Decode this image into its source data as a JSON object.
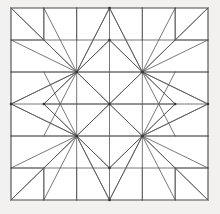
{
  "figure": {
    "title": "Eight-Pointed Star Quilt Block",
    "kind": "geometric-line-drawing",
    "width": 220,
    "height": 214,
    "background_color": "#f2f1ef",
    "block_fill_color": "#ffffff",
    "line_color": "#555555",
    "border_color": "#4a4a4a",
    "vertex_color": "#333333",
    "line_width": 0.8,
    "border_width": 1.1
  },
  "block": {
    "label": "quilt-block",
    "left": 11,
    "top": 8,
    "right": 208,
    "bottom": 200,
    "grid_columns": 6,
    "grid_rows": 6,
    "cell_width": 32.83,
    "cell_height": 32.0,
    "symmetry": "4-fold mirror (dihedral D4)"
  },
  "grid": {
    "x_positions": [
      11,
      43.83,
      76.67,
      109.5,
      142.33,
      175.17,
      208
    ],
    "y_positions": [
      8,
      40,
      72,
      104,
      136,
      168,
      200
    ],
    "show_interior_horizontals": true,
    "show_interior_verticals_edges_only": true
  },
  "key_points": {
    "center": [
      109.5,
      104
    ],
    "star_top": [
      109.5,
      40
    ],
    "star_bottom": [
      109.5,
      168
    ],
    "star_left": [
      43.83,
      104
    ],
    "star_right": [
      175.17,
      104
    ],
    "hub_top_left": [
      76.67,
      72
    ],
    "hub_top_right": [
      142.33,
      72
    ],
    "hub_bottom_left": [
      76.67,
      136
    ],
    "hub_bottom_right": [
      142.33,
      136
    ],
    "edge_mid_left": [
      11,
      104
    ],
    "edge_mid_right": [
      208,
      104
    ],
    "edge_mid_top": [
      109.5,
      8
    ],
    "edge_mid_bottom": [
      109.5,
      200
    ]
  },
  "corner_blocks": {
    "count": 4,
    "description": "square sub-block with single diagonal in each outer corner",
    "size_cells": 1,
    "top_left": {
      "x": 11,
      "y": 8,
      "w": 32.83,
      "h": 32
    },
    "top_right": {
      "x": 175.17,
      "y": 8,
      "w": 32.83,
      "h": 32
    },
    "bottom_left": {
      "x": 11,
      "y": 168,
      "w": 32.83,
      "h": 32
    },
    "bottom_right": {
      "x": 175.17,
      "y": 168,
      "w": 32.83,
      "h": 32
    }
  },
  "chart_data": {
    "type": "line",
    "title": "Eight-Pointed Star Quilt Block",
    "xlabel": "",
    "ylabel": "",
    "xlim": [
      0,
      220
    ],
    "ylim": [
      0,
      214
    ],
    "grid": false,
    "legend": "none",
    "series": [
      {
        "name": "outer-border",
        "kind": "polygon",
        "points": [
          [
            11,
            8
          ],
          [
            208,
            8
          ],
          [
            208,
            200
          ],
          [
            11,
            200
          ]
        ]
      },
      {
        "name": "grid-horizontals",
        "kind": "segments",
        "points": [
          [
            11,
            40
          ],
          [
            208,
            40
          ],
          [
            11,
            72
          ],
          [
            208,
            72
          ],
          [
            11,
            104
          ],
          [
            208,
            104
          ],
          [
            11,
            136
          ],
          [
            208,
            136
          ],
          [
            11,
            168
          ],
          [
            208,
            168
          ]
        ]
      },
      {
        "name": "grid-verticals-outer",
        "kind": "segments",
        "points": [
          [
            43.83,
            8
          ],
          [
            43.83,
            40
          ],
          [
            76.67,
            8
          ],
          [
            76.67,
            40
          ],
          [
            109.5,
            8
          ],
          [
            109.5,
            40
          ],
          [
            142.33,
            8
          ],
          [
            142.33,
            40
          ],
          [
            175.17,
            8
          ],
          [
            175.17,
            40
          ],
          [
            43.83,
            168
          ],
          [
            43.83,
            200
          ],
          [
            76.67,
            168
          ],
          [
            76.67,
            200
          ],
          [
            109.5,
            168
          ],
          [
            109.5,
            200
          ],
          [
            142.33,
            168
          ],
          [
            142.33,
            200
          ],
          [
            175.17,
            168
          ],
          [
            175.17,
            200
          ]
        ]
      },
      {
        "name": "star-outer-diamond",
        "kind": "polygon",
        "points": [
          [
            109.5,
            40
          ],
          [
            175.17,
            104
          ],
          [
            109.5,
            168
          ],
          [
            43.83,
            104
          ]
        ]
      },
      {
        "name": "star-inner-cross",
        "kind": "segments",
        "points": [
          [
            109.5,
            40
          ],
          [
            109.5,
            168
          ],
          [
            43.83,
            104
          ],
          [
            175.17,
            104
          ],
          [
            76.67,
            72
          ],
          [
            142.33,
            136
          ],
          [
            142.33,
            72
          ],
          [
            76.67,
            136
          ]
        ]
      },
      {
        "name": "star-hub-diamond",
        "kind": "polygon",
        "points": [
          [
            76.67,
            72
          ],
          [
            142.33,
            72
          ],
          [
            142.33,
            136
          ],
          [
            76.67,
            136
          ]
        ]
      },
      {
        "name": "hub-rays-top-left",
        "kind": "fan",
        "origin": [
          76.67,
          72
        ],
        "targets": [
          [
            11,
            8
          ],
          [
            43.83,
            8
          ],
          [
            76.67,
            8
          ],
          [
            109.5,
            8
          ],
          [
            11,
            40
          ],
          [
            11,
            72
          ],
          [
            11,
            104
          ],
          [
            43.83,
            136
          ],
          [
            43.83,
            40
          ],
          [
            109.5,
            40
          ],
          [
            43.83,
            104
          ],
          [
            109.5,
            104
          ]
        ]
      },
      {
        "name": "hub-rays-top-right",
        "kind": "fan",
        "origin": [
          142.33,
          72
        ],
        "targets": [
          [
            208,
            8
          ],
          [
            175.17,
            8
          ],
          [
            142.33,
            8
          ],
          [
            109.5,
            8
          ],
          [
            208,
            40
          ],
          [
            208,
            72
          ],
          [
            208,
            104
          ],
          [
            175.17,
            136
          ],
          [
            175.17,
            40
          ],
          [
            109.5,
            40
          ],
          [
            175.17,
            104
          ],
          [
            109.5,
            104
          ]
        ]
      },
      {
        "name": "hub-rays-bottom-left",
        "kind": "fan",
        "origin": [
          76.67,
          136
        ],
        "targets": [
          [
            11,
            200
          ],
          [
            43.83,
            200
          ],
          [
            76.67,
            200
          ],
          [
            109.5,
            200
          ],
          [
            11,
            168
          ],
          [
            11,
            136
          ],
          [
            11,
            104
          ],
          [
            43.83,
            72
          ],
          [
            43.83,
            168
          ],
          [
            109.5,
            168
          ],
          [
            43.83,
            104
          ],
          [
            109.5,
            104
          ]
        ]
      },
      {
        "name": "hub-rays-bottom-right",
        "kind": "fan",
        "origin": [
          142.33,
          136
        ],
        "targets": [
          [
            208,
            200
          ],
          [
            175.17,
            200
          ],
          [
            142.33,
            200
          ],
          [
            109.5,
            200
          ],
          [
            208,
            168
          ],
          [
            208,
            136
          ],
          [
            208,
            104
          ],
          [
            175.17,
            72
          ],
          [
            175.17,
            168
          ],
          [
            109.5,
            168
          ],
          [
            175.17,
            104
          ],
          [
            109.5,
            104
          ]
        ]
      },
      {
        "name": "corner-square-top-left",
        "kind": "polyline",
        "points": [
          [
            43.83,
            8
          ],
          [
            43.83,
            40
          ],
          [
            11,
            40
          ]
        ]
      },
      {
        "name": "corner-square-top-right",
        "kind": "polyline",
        "points": [
          [
            175.17,
            8
          ],
          [
            175.17,
            40
          ],
          [
            208,
            40
          ]
        ]
      },
      {
        "name": "corner-square-bottom-left",
        "kind": "polyline",
        "points": [
          [
            43.83,
            200
          ],
          [
            43.83,
            168
          ],
          [
            11,
            168
          ]
        ]
      },
      {
        "name": "corner-square-bottom-right",
        "kind": "polyline",
        "points": [
          [
            175.17,
            200
          ],
          [
            175.17,
            168
          ],
          [
            208,
            168
          ]
        ]
      },
      {
        "name": "corner-diagonals",
        "kind": "segments",
        "points": [
          [
            11,
            8
          ],
          [
            43.83,
            40
          ],
          [
            208,
            8
          ],
          [
            175.17,
            40
          ],
          [
            11,
            200
          ],
          [
            43.83,
            168
          ],
          [
            208,
            200
          ],
          [
            175.17,
            168
          ]
        ]
      },
      {
        "name": "edge-mid-rays",
        "kind": "segments",
        "points": [
          [
            11,
            104
          ],
          [
            76.67,
            72
          ],
          [
            11,
            104
          ],
          [
            76.67,
            136
          ],
          [
            208,
            104
          ],
          [
            142.33,
            72
          ],
          [
            208,
            104
          ],
          [
            142.33,
            136
          ],
          [
            109.5,
            8
          ],
          [
            76.67,
            72
          ],
          [
            109.5,
            8
          ],
          [
            142.33,
            72
          ],
          [
            109.5,
            200
          ],
          [
            76.67,
            136
          ],
          [
            109.5,
            200
          ],
          [
            142.33,
            136
          ]
        ]
      }
    ],
    "vertex_markers": [
      [
        109.5,
        104
      ],
      [
        76.67,
        72
      ],
      [
        142.33,
        72
      ],
      [
        76.67,
        136
      ],
      [
        142.33,
        136
      ],
      [
        109.5,
        40
      ],
      [
        109.5,
        168
      ],
      [
        43.83,
        104
      ],
      [
        175.17,
        104
      ],
      [
        11,
        104
      ],
      [
        208,
        104
      ],
      [
        109.5,
        8
      ],
      [
        109.5,
        200
      ]
    ]
  }
}
